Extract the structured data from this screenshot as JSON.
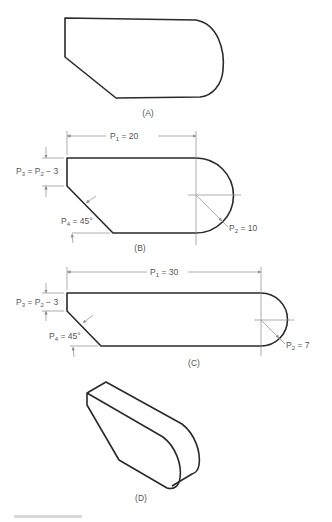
{
  "figures": [
    {
      "id": "A",
      "caption": "(A)"
    },
    {
      "id": "B",
      "caption": "(B)",
      "dims": {
        "p1": {
          "name": "P",
          "sub": "1",
          "value": " = 20"
        },
        "p2": {
          "name": "P",
          "sub": "2",
          "value": " = 10"
        },
        "p3": {
          "lhs": "P",
          "lhs_sub": "3",
          "eq": " = P",
          "rhs_sub": "2",
          "rest": " − 3"
        },
        "p4": {
          "name": "P",
          "sub": "4",
          "value": " = 45°"
        }
      }
    },
    {
      "id": "C",
      "caption": "(C)",
      "dims": {
        "p1": {
          "name": "P",
          "sub": "1",
          "value": " = 30"
        },
        "p2": {
          "name": "P",
          "sub": "2",
          "value": " = 7"
        },
        "p3": {
          "lhs": "P",
          "lhs_sub": "3",
          "eq": " = P",
          "rhs_sub": "2",
          "rest": " − 3"
        },
        "p4": {
          "name": "P",
          "sub": "4",
          "value": " = 45°"
        }
      }
    },
    {
      "id": "D",
      "caption": "(D)"
    }
  ],
  "colors": {
    "outline": "#2a2a2a",
    "dimension": "#8a8a8a",
    "text": "#555555"
  }
}
